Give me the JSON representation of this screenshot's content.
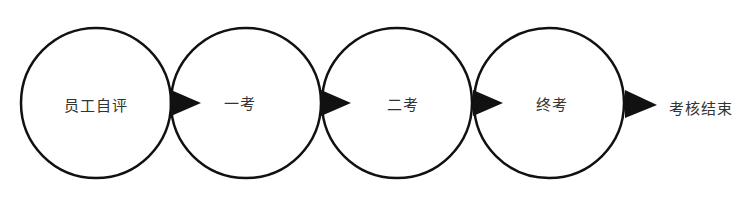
{
  "diagram": {
    "type": "process-flow",
    "stages": [
      {
        "label": "员工自评"
      },
      {
        "label": "一考"
      },
      {
        "label": "二考"
      },
      {
        "label": "终考"
      }
    ],
    "end_label": "考核结束",
    "colors": {
      "stroke": "#111111",
      "arrow": "#111111",
      "text": "#333333",
      "background": "#ffffff"
    }
  }
}
